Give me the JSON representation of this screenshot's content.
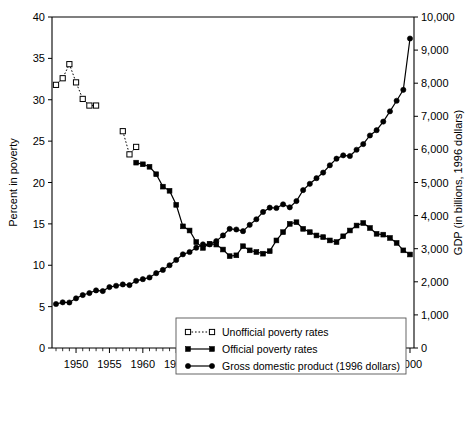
{
  "chart_data": {
    "type": "line",
    "title": "",
    "xlabel": "",
    "ylabel": "Percent in poverty",
    "y2label": "GDP (in billions, 1996 dollars)",
    "xlim": [
      1946.4,
      2000.6
    ],
    "ylim": [
      0,
      40
    ],
    "y2lim": [
      0,
      10000
    ],
    "grid": false,
    "legend_position": "bottom-center-inside",
    "x_ticks": [
      1950,
      1955,
      1960,
      1965,
      1970,
      1975,
      1980,
      1985,
      1990,
      1995,
      2000
    ],
    "x_tick_labels": [
      "1950",
      "1955",
      "1960",
      "1965",
      "1970",
      "1975",
      "1980",
      "1985",
      "1990",
      "1995",
      "2000"
    ],
    "x_minor_tick_step": 1,
    "y_ticks": [
      0,
      5,
      10,
      15,
      20,
      25,
      30,
      35,
      40
    ],
    "y_tick_labels": [
      "0",
      "5",
      "10",
      "15",
      "20",
      "25",
      "30",
      "35",
      "40"
    ],
    "y2_ticks": [
      0,
      1000,
      2000,
      3000,
      4000,
      5000,
      6000,
      7000,
      8000,
      9000,
      10000
    ],
    "y2_tick_labels": [
      "0",
      "1,000",
      "2,000",
      "3,000",
      "4,000",
      "5,000",
      "6,000",
      "7,000",
      "8,000",
      "9,000",
      "10,000"
    ],
    "series": [
      {
        "name": "Unofficial poverty rates",
        "axis": "left",
        "marker": "open-square",
        "linestyle": "dotted",
        "color": "#000000",
        "segments": [
          {
            "x": [
              1947,
              1948,
              1949,
              1950,
              1951,
              1952,
              1953
            ],
            "y": [
              31.8,
              32.6,
              34.3,
              32.1,
              30.1,
              29.3,
              29.3
            ]
          },
          {
            "x": [
              1957,
              1958,
              1959
            ],
            "y": [
              26.2,
              23.4,
              24.3
            ]
          }
        ]
      },
      {
        "name": "Official poverty rates",
        "axis": "left",
        "marker": "filled-square",
        "linestyle": "solid",
        "color": "#000000",
        "x": [
          1959,
          1960,
          1961,
          1962,
          1963,
          1964,
          1965,
          1966,
          1967,
          1968,
          1969,
          1970,
          1971,
          1972,
          1973,
          1974,
          1975,
          1976,
          1977,
          1978,
          1979,
          1980,
          1981,
          1982,
          1983,
          1984,
          1985,
          1986,
          1987,
          1988,
          1989,
          1990,
          1991,
          1992,
          1993,
          1994,
          1995,
          1996,
          1997,
          1998,
          1999,
          2000
        ],
        "y": [
          22.4,
          22.2,
          21.9,
          21.0,
          19.5,
          19.0,
          17.3,
          14.7,
          14.2,
          12.8,
          12.1,
          12.6,
          12.5,
          11.9,
          11.1,
          11.2,
          12.3,
          11.8,
          11.6,
          11.4,
          11.7,
          13.0,
          14.0,
          15.0,
          15.2,
          14.4,
          14.0,
          13.6,
          13.4,
          13.0,
          12.8,
          13.5,
          14.2,
          14.8,
          15.1,
          14.5,
          13.8,
          13.7,
          13.3,
          12.7,
          11.8,
          11.3
        ]
      },
      {
        "name": "Gross domestic product (1996 dollars)",
        "axis": "right",
        "marker": "filled-circle",
        "linestyle": "solid",
        "color": "#000000",
        "x": [
          1947,
          1948,
          1949,
          1950,
          1951,
          1952,
          1953,
          1954,
          1955,
          1956,
          1957,
          1958,
          1959,
          1960,
          1961,
          1962,
          1963,
          1964,
          1965,
          1966,
          1967,
          1968,
          1969,
          1970,
          1971,
          1972,
          1973,
          1974,
          1975,
          1976,
          1977,
          1978,
          1979,
          1980,
          1981,
          1982,
          1983,
          1984,
          1985,
          1986,
          1987,
          1988,
          1989,
          1990,
          1991,
          1992,
          1993,
          1994,
          1995,
          1996,
          1997,
          1998,
          1999,
          2000
        ],
        "y": [
          1330,
          1380,
          1375,
          1500,
          1600,
          1660,
          1740,
          1720,
          1840,
          1880,
          1920,
          1900,
          2030,
          2080,
          2130,
          2260,
          2360,
          2500,
          2660,
          2830,
          2900,
          3030,
          3130,
          3130,
          3230,
          3400,
          3600,
          3580,
          3530,
          3720,
          3890,
          4110,
          4240,
          4230,
          4340,
          4250,
          4440,
          4770,
          4960,
          5130,
          5300,
          5520,
          5720,
          5820,
          5800,
          5990,
          6160,
          6420,
          6580,
          6840,
          7150,
          7470,
          7800,
          9350
        ]
      }
    ]
  },
  "legend": {
    "items": [
      {
        "label": "Unofficial poverty rates",
        "marker": "open-square",
        "linestyle": "dotted"
      },
      {
        "label": "Official poverty rates",
        "marker": "filled-square",
        "linestyle": "solid"
      },
      {
        "label": "Gross domestic product (1996 dollars)",
        "marker": "filled-circle",
        "linestyle": "solid"
      }
    ]
  },
  "colors": {
    "ink": "#000000",
    "background": "#ffffff",
    "legend_border": "#555555"
  }
}
